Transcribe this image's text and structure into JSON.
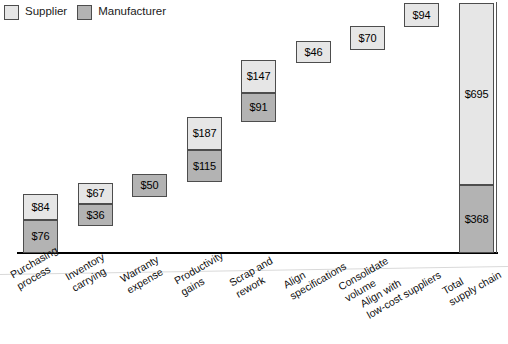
{
  "legend": {
    "entries": [
      {
        "label": "Supplier",
        "key": "supplier",
        "color": "#e6e6e6"
      },
      {
        "label": "Manufacturer",
        "key": "manufacturer",
        "color": "#b3b3b3"
      }
    ]
  },
  "chart_data": {
    "type": "bar",
    "title": "",
    "subtitle": "",
    "xlabel": "",
    "ylabel": "",
    "grid": false,
    "legend_position": "top-left",
    "stacked": true,
    "waterfall": true,
    "ylim": [
      0,
      1063
    ],
    "categories": [
      "Purchasing process",
      "Inventory carrying",
      "Warranty expense",
      "Productivity gains",
      "Scrap and rework",
      "Align specifications",
      "Consolidate volume",
      "Align with low-cost suppliers",
      "Total supply chain"
    ],
    "category_lines": [
      [
        "Purchasing",
        "process"
      ],
      [
        "Inventory",
        "carrying"
      ],
      [
        "Warranty",
        "expense"
      ],
      [
        "Productivity",
        "gains"
      ],
      [
        "Scrap and",
        "rework"
      ],
      [
        "Align",
        "specifications"
      ],
      [
        "Consolidate",
        "volume"
      ],
      [
        "Align with",
        "low-cost suppliers"
      ],
      [
        "Total",
        "supply chain"
      ]
    ],
    "series": [
      {
        "name": "Supplier",
        "values": [
          84,
          67,
          null,
          187,
          147,
          46,
          70,
          94,
          695
        ]
      },
      {
        "name": "Manufacturer",
        "values": [
          76,
          36,
          50,
          115,
          91,
          null,
          null,
          null,
          368
        ]
      }
    ],
    "bars": [
      {
        "category": "Purchasing process",
        "segments": [
          {
            "series": "Supplier",
            "label": "$84",
            "value": 84
          },
          {
            "series": "Manufacturer",
            "label": "$76",
            "value": 76
          }
        ]
      },
      {
        "category": "Inventory carrying",
        "segments": [
          {
            "series": "Supplier",
            "label": "$67",
            "value": 67
          },
          {
            "series": "Manufacturer",
            "label": "$36",
            "value": 36
          }
        ]
      },
      {
        "category": "Warranty expense",
        "segments": [
          {
            "series": "Manufacturer",
            "label": "$50",
            "value": 50
          }
        ]
      },
      {
        "category": "Productivity gains",
        "segments": [
          {
            "series": "Supplier",
            "label": "$187",
            "value": 187
          },
          {
            "series": "Manufacturer",
            "label": "$115",
            "value": 115
          }
        ]
      },
      {
        "category": "Scrap and rework",
        "segments": [
          {
            "series": "Supplier",
            "label": "$147",
            "value": 147
          },
          {
            "series": "Manufacturer",
            "label": "$91",
            "value": 91
          }
        ]
      },
      {
        "category": "Align specifications",
        "segments": [
          {
            "series": "Supplier",
            "label": "$46",
            "value": 46
          }
        ]
      },
      {
        "category": "Consolidate volume",
        "segments": [
          {
            "series": "Supplier",
            "label": "$70",
            "value": 70
          }
        ]
      },
      {
        "category": "Align with low-cost suppliers",
        "segments": [
          {
            "series": "Supplier",
            "label": "$94",
            "value": 94
          }
        ]
      },
      {
        "category": "Total supply chain",
        "segments": [
          {
            "series": "Supplier",
            "label": "$695",
            "value": 695
          },
          {
            "series": "Manufacturer",
            "label": "$368",
            "value": 368
          }
        ]
      }
    ]
  },
  "geometry": {
    "bars": [
      {
        "x": 23,
        "w": 35,
        "segments": [
          {
            "top": 194,
            "h": 26,
            "cls": "supplier",
            "bind": "chart_data.bars.0.segments.0.label"
          },
          {
            "top": 220,
            "h": 33,
            "cls": "manufacturer",
            "bind": "chart_data.bars.0.segments.1.label"
          }
        ]
      },
      {
        "x": 78,
        "w": 35,
        "segments": [
          {
            "top": 183,
            "h": 21,
            "cls": "supplier",
            "bind": "chart_data.bars.1.segments.0.label"
          },
          {
            "top": 204,
            "h": 22,
            "cls": "manufacturer",
            "bind": "chart_data.bars.1.segments.1.label"
          }
        ]
      },
      {
        "x": 132,
        "w": 35,
        "segments": [
          {
            "top": 174,
            "h": 23,
            "cls": "manufacturer",
            "bind": "chart_data.bars.2.segments.0.label"
          }
        ]
      },
      {
        "x": 187,
        "w": 35,
        "segments": [
          {
            "top": 117,
            "h": 33,
            "cls": "supplier",
            "bind": "chart_data.bars.3.segments.0.label"
          },
          {
            "top": 150,
            "h": 32,
            "cls": "manufacturer",
            "bind": "chart_data.bars.3.segments.1.label"
          }
        ]
      },
      {
        "x": 241,
        "w": 35,
        "segments": [
          {
            "top": 60,
            "h": 33,
            "cls": "supplier",
            "bind": "chart_data.bars.4.segments.0.label"
          },
          {
            "top": 93,
            "h": 29,
            "cls": "manufacturer",
            "bind": "chart_data.bars.4.segments.1.label"
          }
        ]
      },
      {
        "x": 296,
        "w": 35,
        "segments": [
          {
            "top": 41,
            "h": 22,
            "cls": "supplier",
            "bind": "chart_data.bars.5.segments.0.label"
          }
        ]
      },
      {
        "x": 350,
        "w": 35,
        "segments": [
          {
            "top": 26,
            "h": 24,
            "cls": "supplier",
            "bind": "chart_data.bars.6.segments.0.label"
          }
        ]
      },
      {
        "x": 404,
        "w": 35,
        "segments": [
          {
            "top": 3,
            "h": 24,
            "cls": "supplier",
            "bind": "chart_data.bars.7.segments.0.label"
          }
        ]
      },
      {
        "x": 459,
        "w": 35,
        "segments": [
          {
            "top": 3,
            "h": 182,
            "cls": "supplier",
            "bind": "chart_data.bars.8.segments.0.label"
          },
          {
            "top": 185,
            "h": 68,
            "cls": "manufacturer",
            "bind": "chart_data.bars.8.segments.1.label"
          }
        ]
      }
    ],
    "cat_labels": [
      {
        "x": 8,
        "y": 14
      },
      {
        "x": 63,
        "y": 16
      },
      {
        "x": 118,
        "y": 18
      },
      {
        "x": 172,
        "y": 20
      },
      {
        "x": 227,
        "y": 22
      },
      {
        "x": 281,
        "y": 24
      },
      {
        "x": 336,
        "y": 26
      },
      {
        "x": 358,
        "y": 43
      },
      {
        "x": 440,
        "y": 30
      }
    ]
  }
}
